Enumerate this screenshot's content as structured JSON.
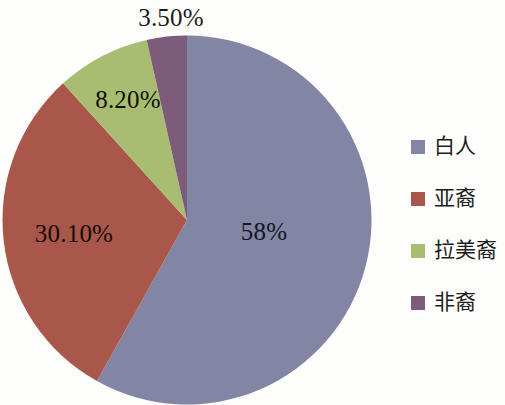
{
  "chart_data": {
    "type": "pie",
    "title": "",
    "categories": [
      "白人",
      "亚裔",
      "拉美裔",
      "非裔"
    ],
    "values": [
      58,
      30.1,
      8.2,
      3.5
    ],
    "value_labels": [
      "58%",
      "30.10%",
      "8.20%",
      "3.50%"
    ],
    "colors": [
      "#8285a4",
      "#a9574a",
      "#a9bd72",
      "#7d5b7a"
    ],
    "legend_position": "right",
    "grid": false,
    "start_angle_deg": 0,
    "direction": "clockwise"
  },
  "labels": {
    "white": "58%",
    "asian": "30.10%",
    "latino": "8.20%",
    "african": "3.50%"
  },
  "legend": {
    "items": [
      {
        "label": "白人",
        "color": "#8285a4"
      },
      {
        "label": "亚裔",
        "color": "#a9574a"
      },
      {
        "label": "拉美裔",
        "color": "#a9bd72"
      },
      {
        "label": "非裔",
        "color": "#7d5b7a"
      }
    ]
  },
  "theme": {
    "background": "#fdfdfb",
    "label_color": "#1a1a1a"
  }
}
